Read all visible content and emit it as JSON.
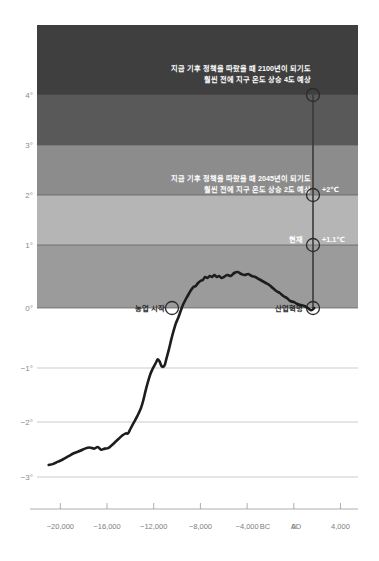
{
  "chart_data": {
    "type": "line",
    "title": "",
    "subtitle": "",
    "xlabel": "",
    "ylabel": "",
    "xlim": [
      -22000,
      5500
    ],
    "ylim": [
      -3.4,
      4.6
    ],
    "grid": true,
    "legend": null,
    "x_ticks": [
      {
        "value": -20000,
        "label": "−20,000"
      },
      {
        "value": -16000,
        "label": "−16,000"
      },
      {
        "value": -12000,
        "label": "−12,000"
      },
      {
        "value": -8000,
        "label": "−8,000"
      },
      {
        "value": -4000,
        "label": "−4,000"
      },
      {
        "value": 0,
        "label": "0"
      },
      {
        "value": 4000,
        "label": "4,000"
      }
    ],
    "x_era_left": "BC",
    "x_era_right": "AD",
    "y_ticks": [
      {
        "value": 4,
        "label": "4°"
      },
      {
        "value": 3,
        "label": "3°"
      },
      {
        "value": 2,
        "label": "2°"
      },
      {
        "value": 1,
        "label": "1°"
      },
      {
        "value": 0,
        "label": "0°"
      },
      {
        "value": -1,
        "label": "−1°"
      },
      {
        "value": -2,
        "label": "−2°"
      },
      {
        "value": -3,
        "label": "−3°"
      }
    ],
    "bands": [
      {
        "from": 4,
        "to": 4.6,
        "color": "#3f3f3f",
        "name": "band-4-plus"
      },
      {
        "from": 3,
        "to": 4,
        "color": "#595959",
        "name": "band-3-4"
      },
      {
        "from": 2,
        "to": 3,
        "color": "#8c8c8c",
        "name": "band-2-3"
      },
      {
        "from": 1,
        "to": 2,
        "color": "#b5b5b5",
        "name": "band-1-2"
      },
      {
        "from": 0,
        "to": 1,
        "color": "#9b9b9b",
        "name": "band-0-1"
      }
    ],
    "series": [
      {
        "name": "global-temperature-anomaly",
        "color": "#1d1d1d",
        "points": [
          [
            -21000,
            -2.88
          ],
          [
            -20600,
            -2.86
          ],
          [
            -20200,
            -2.82
          ],
          [
            -19800,
            -2.78
          ],
          [
            -19300,
            -2.72
          ],
          [
            -18800,
            -2.66
          ],
          [
            -18300,
            -2.62
          ],
          [
            -17900,
            -2.58
          ],
          [
            -17500,
            -2.56
          ],
          [
            -17100,
            -2.58
          ],
          [
            -16800,
            -2.55
          ],
          [
            -16500,
            -2.6
          ],
          [
            -16200,
            -2.58
          ],
          [
            -15900,
            -2.57
          ],
          [
            -15600,
            -2.52
          ],
          [
            -15300,
            -2.46
          ],
          [
            -15000,
            -2.4
          ],
          [
            -14700,
            -2.34
          ],
          [
            -14400,
            -2.3
          ],
          [
            -14200,
            -2.3
          ],
          [
            -14000,
            -2.22
          ],
          [
            -13700,
            -2.1
          ],
          [
            -13400,
            -1.98
          ],
          [
            -13100,
            -1.84
          ],
          [
            -12900,
            -1.7
          ],
          [
            -12700,
            -1.52
          ],
          [
            -12500,
            -1.36
          ],
          [
            -12300,
            -1.22
          ],
          [
            -12100,
            -1.12
          ],
          [
            -11900,
            -1.04
          ],
          [
            -11800,
            -1.0
          ],
          [
            -11650,
            -0.94
          ],
          [
            -11500,
            -0.98
          ],
          [
            -11350,
            -1.06
          ],
          [
            -11200,
            -1.08
          ],
          [
            -11050,
            -1.04
          ],
          [
            -10900,
            -0.92
          ],
          [
            -10700,
            -0.76
          ],
          [
            -10500,
            -0.58
          ],
          [
            -10300,
            -0.42
          ],
          [
            -10100,
            -0.28
          ],
          [
            -9900,
            -0.18
          ],
          [
            -9700,
            -0.06
          ],
          [
            -9500,
            0.06
          ],
          [
            -9200,
            0.2
          ],
          [
            -9000,
            0.28
          ],
          [
            -8800,
            0.36
          ],
          [
            -8600,
            0.42
          ],
          [
            -8400,
            0.44
          ],
          [
            -8200,
            0.5
          ],
          [
            -8000,
            0.54
          ],
          [
            -7800,
            0.56
          ],
          [
            -7600,
            0.62
          ],
          [
            -7400,
            0.6
          ],
          [
            -7200,
            0.64
          ],
          [
            -7000,
            0.62
          ],
          [
            -6800,
            0.66
          ],
          [
            -6600,
            0.62
          ],
          [
            -6400,
            0.64
          ],
          [
            -6200,
            0.6
          ],
          [
            -6000,
            0.62
          ],
          [
            -5700,
            0.66
          ],
          [
            -5400,
            0.64
          ],
          [
            -5100,
            0.7
          ],
          [
            -4800,
            0.72
          ],
          [
            -4500,
            0.68
          ],
          [
            -4200,
            0.66
          ],
          [
            -3900,
            0.68
          ],
          [
            -3600,
            0.64
          ],
          [
            -3300,
            0.62
          ],
          [
            -3000,
            0.58
          ],
          [
            -2700,
            0.54
          ],
          [
            -2400,
            0.5
          ],
          [
            -2100,
            0.46
          ],
          [
            -1800,
            0.4
          ],
          [
            -1500,
            0.34
          ],
          [
            -1200,
            0.3
          ],
          [
            -900,
            0.24
          ],
          [
            -600,
            0.2
          ],
          [
            -300,
            0.14
          ],
          [
            0,
            0.12
          ],
          [
            300,
            0.08
          ],
          [
            600,
            0.06
          ],
          [
            900,
            0.04
          ],
          [
            1200,
            0.0
          ],
          [
            1500,
            -0.04
          ],
          [
            1750,
            0.0
          ]
        ]
      }
    ],
    "markers": [
      {
        "name": "agriculture-start",
        "label": "농업 시작",
        "x": -9700,
        "y": 0,
        "label_side": "left"
      },
      {
        "name": "industrial-revolution",
        "label": "산업혁명",
        "x": 1750,
        "y": 0,
        "label_side": "left"
      },
      {
        "name": "present-day",
        "label": "현재",
        "value_label": "+1.1℃",
        "x": 1750,
        "y": 1.1,
        "label_side": "left"
      },
      {
        "name": "projection-2-degrees",
        "label": "",
        "value_label": "+2℃",
        "x": 1750,
        "y": 2.0,
        "label_side": "right"
      },
      {
        "name": "projection-4-degrees",
        "label": "",
        "value_label": "",
        "x": 1750,
        "y": 4.0,
        "label_side": "right"
      }
    ],
    "annotations": [
      {
        "name": "annotation-4-degrees",
        "lines": [
          "지금 기후 정책을 따랐을 때 2100년이 되기도",
          "훨씬 전에 지구 온도 상승 4도 예상"
        ],
        "x": 1600,
        "y": 4.38
      },
      {
        "name": "annotation-2-degrees",
        "lines": [
          "지금 기후 정책을 따랐을 때 2045년이 되기도",
          "훨씬 전에 지구 온도 상승 2도 예상"
        ],
        "x": 1600,
        "y": 2.35
      }
    ]
  }
}
